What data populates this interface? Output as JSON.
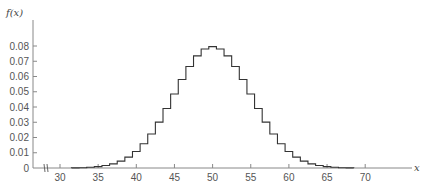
{
  "chart_data": {
    "type": "step",
    "title": "",
    "xlabel": "x",
    "ylabel": "f(x)",
    "x_ticks": [
      30,
      35,
      40,
      45,
      50,
      55,
      60,
      65,
      70
    ],
    "y_ticks": [
      0,
      0.01,
      0.02,
      0.03,
      0.04,
      0.05,
      0.06,
      0.07,
      0.08
    ],
    "y_tick_labels": [
      "0",
      "0.01",
      "0.02",
      "0.03",
      "0.04",
      "0.05",
      "0.06",
      "0.07",
      "0.08"
    ],
    "x_tick_labels": [
      "30",
      "35",
      "40",
      "45",
      "50",
      "55",
      "60",
      "65",
      "70"
    ],
    "xlim": [
      27,
      74
    ],
    "ylim": [
      0,
      0.09
    ],
    "axis_break": true,
    "grid": false,
    "legend": null,
    "x": [
      32,
      33,
      34,
      35,
      36,
      37,
      38,
      39,
      40,
      41,
      42,
      43,
      44,
      45,
      46,
      47,
      48,
      49,
      50,
      51,
      52,
      53,
      54,
      55,
      56,
      57,
      58,
      59,
      60,
      61,
      62,
      63,
      64,
      65,
      66,
      67,
      68
    ],
    "values": [
      0.0001,
      0.0002,
      0.0005,
      0.0009,
      0.0016,
      0.0027,
      0.0045,
      0.0071,
      0.0108,
      0.0159,
      0.0223,
      0.0301,
      0.039,
      0.0485,
      0.058,
      0.0666,
      0.0735,
      0.078,
      0.0796,
      0.078,
      0.0735,
      0.0666,
      0.058,
      0.0485,
      0.039,
      0.0301,
      0.0223,
      0.0159,
      0.0108,
      0.0071,
      0.0045,
      0.0027,
      0.0016,
      0.0009,
      0.0005,
      0.0002,
      0.0001
    ]
  }
}
